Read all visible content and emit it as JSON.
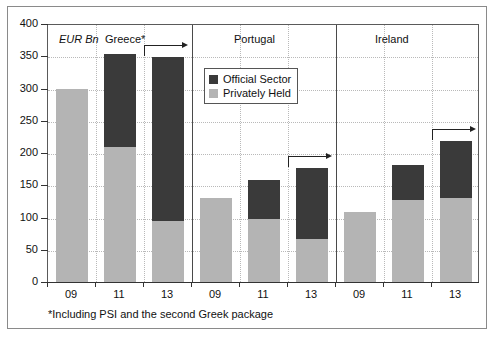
{
  "chart_data": {
    "type": "bar",
    "title": "",
    "subtitle": "",
    "unit_label": "EUR Bn",
    "xlabel": "",
    "ylabel": "",
    "ylim": [
      0,
      400
    ],
    "ytick_values": [
      0,
      50,
      100,
      150,
      200,
      250,
      300,
      350,
      400
    ],
    "ytick_labels": [
      "0",
      "50",
      "100",
      "150",
      "200",
      "250",
      "300",
      "350",
      "400"
    ],
    "grid": true,
    "legend_position": "upper-center",
    "stacked": true,
    "categories": [
      "09",
      "11",
      "13",
      "09",
      "11",
      "13",
      "09",
      "11",
      "13"
    ],
    "groups": [
      {
        "name": "Greece*",
        "categories": [
          "09",
          "11",
          "13"
        ],
        "arrow_on": "13"
      },
      {
        "name": "Portugal",
        "categories": [
          "09",
          "11",
          "13"
        ],
        "arrow_on": "13"
      },
      {
        "name": "Ireland",
        "categories": [
          "09",
          "11",
          "13"
        ],
        "arrow_on": "13"
      }
    ],
    "series": [
      {
        "name": "Privately Held",
        "color": "#b4b4b4",
        "values": [
          300,
          210,
          95,
          131,
          98,
          67,
          109,
          127,
          131
        ]
      },
      {
        "name": "Official Sector",
        "color": "#3a3a3a",
        "values": [
          0,
          143,
          254,
          0,
          60,
          110,
          0,
          55,
          87
        ]
      }
    ],
    "totals": [
      300,
      353,
      349,
      131,
      158,
      177,
      109,
      182,
      218
    ],
    "annotations": [
      {
        "type": "arrow",
        "group": "Greece*",
        "at": "13",
        "direction": "right"
      },
      {
        "type": "arrow",
        "group": "Portugal",
        "at": "13",
        "direction": "right"
      },
      {
        "type": "arrow",
        "group": "Ireland",
        "at": "13",
        "direction": "right"
      }
    ],
    "footnote": "*Including PSI and the second Greek package"
  },
  "legend": {
    "items": [
      {
        "label": "Official Sector"
      },
      {
        "label": "Privately Held"
      }
    ]
  },
  "labels": {
    "unit": "EUR Bn",
    "group_greece": "Greece*",
    "group_portugal": "Portugal",
    "group_ireland": "Ireland",
    "footnote": "*Including PSI and the second Greek package",
    "y_400": "400",
    "y_350": "350",
    "y_300": "300",
    "y_250": "250",
    "y_200": "200",
    "y_150": "150",
    "y_100": "100",
    "y_50": "50",
    "y_0": "0",
    "x_g1_09": "09",
    "x_g1_11": "11",
    "x_g1_13": "13",
    "x_g2_09": "09",
    "x_g2_11": "11",
    "x_g2_13": "13",
    "x_g3_09": "09",
    "x_g3_11": "11",
    "x_g3_13": "13"
  }
}
